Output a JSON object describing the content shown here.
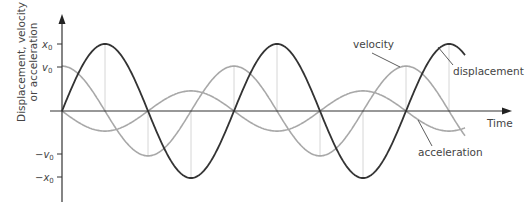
{
  "chart_data": {
    "type": "line",
    "title": "",
    "xlabel": "Time",
    "ylabel": "Displacement, velocity or acceleration",
    "ylabel_lines": [
      "Displacement, velocity",
      "or acceleration"
    ],
    "y_ticks": [
      {
        "label": "x",
        "sub": "0",
        "value": 1.0,
        "prefix": ""
      },
      {
        "label": "v",
        "sub": "0",
        "value": 0.67,
        "prefix": ""
      },
      {
        "label": "v",
        "sub": "0",
        "value": -0.67,
        "prefix": "−"
      },
      {
        "label": "x",
        "sub": "0",
        "value": -1.0,
        "prefix": "−"
      }
    ],
    "x_range_periods": [
      0,
      2.35
    ],
    "grid": false,
    "legend_position": "inline-annotations",
    "series": [
      {
        "name": "displacement",
        "function": "x0*sin(wt)",
        "amplitude": 1.0,
        "phase_deg": 0,
        "color": "#333333"
      },
      {
        "name": "velocity",
        "function": "v0*cos(wt)",
        "amplitude": 0.67,
        "phase_deg": 90,
        "color": "#aaaaaa"
      },
      {
        "name": "acceleration",
        "function": "-a0*sin(wt)",
        "amplitude": 0.3,
        "phase_deg": 180,
        "color": "#aaaaaa"
      }
    ],
    "annotations": [
      "velocity",
      "displacement",
      "acceleration"
    ]
  },
  "labels": {
    "ylabel_line1": "Displacement, velocity",
    "ylabel_line2": "or acceleration",
    "xlabel": "Time",
    "velocity": "velocity",
    "displacement": "displacement",
    "acceleration": "acceleration",
    "tick_x": "x",
    "tick_v": "v",
    "tick_sub": "0",
    "minus": "−"
  },
  "colors": {
    "displacement": "#333333",
    "velocity": "#a8a8a8",
    "acceleration": "#a8a8a8",
    "axis": "#333333",
    "dropline": "#cccccc"
  }
}
